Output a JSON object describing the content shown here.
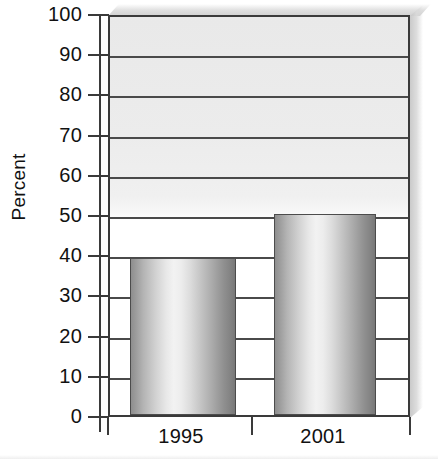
{
  "chart_data": {
    "type": "bar",
    "title": "",
    "subtitle": "",
    "categories": [
      "1995",
      "2001"
    ],
    "values": [
      39,
      50
    ],
    "series": [
      {
        "name": "Percent",
        "values": [
          39,
          50
        ]
      }
    ],
    "xlabel": "",
    "ylabel": "Percent",
    "ylim": [
      0,
      100
    ],
    "ytick_labels": [
      "0",
      "10",
      "20",
      "30",
      "40",
      "50",
      "60",
      "70",
      "80",
      "90",
      "100"
    ],
    "ytick_values": [
      0,
      10,
      20,
      30,
      40,
      50,
      60,
      70,
      80,
      90,
      100
    ],
    "xtick_labels": [
      "1995",
      "2001"
    ],
    "grid": "horizontal",
    "legend": "none",
    "annotations": [],
    "colors": {
      "bar_light": "#f2f2f2",
      "bar_dark": "#787878",
      "bar_outline": "#4c4c4c",
      "grid_line": "#4a4a4a",
      "axis_line": "#3a3a3a",
      "plot_background_upper": "#e9e9e9",
      "plot_background_lower": "#ffffff",
      "text": "#111111",
      "page_background": "#ffffff"
    }
  },
  "axis": {
    "y_title": "Percent"
  }
}
